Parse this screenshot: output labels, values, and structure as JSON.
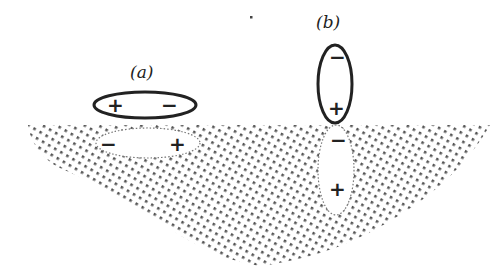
{
  "diagram": {
    "colors": {
      "ink": "#222222",
      "stipple": "#555555",
      "background": "#ffffff"
    },
    "surface": {
      "fill": "stippled",
      "top_y": 125
    },
    "case_a": {
      "label": "(a)",
      "orientation": "horizontal (parallel to surface)",
      "dipole": {
        "left_sign": "+",
        "right_sign": "−",
        "outline": "solid"
      },
      "image": {
        "left_sign": "−",
        "right_sign": "+",
        "outline": "dotted"
      }
    },
    "case_b": {
      "label": "(b)",
      "orientation": "vertical (perpendicular to surface)",
      "dipole": {
        "top_sign": "−",
        "bottom_sign": "+",
        "outline": "solid"
      },
      "image": {
        "top_sign": "−",
        "bottom_sign": "+",
        "outline": "dotted"
      }
    }
  }
}
